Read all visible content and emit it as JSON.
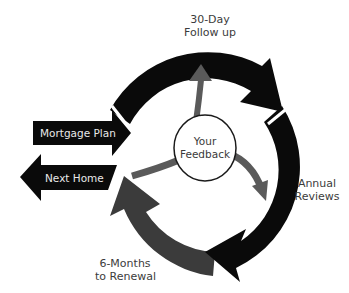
{
  "diagram": {
    "center": {
      "label_line1": "Your",
      "label_line2": "Feedback"
    },
    "cycle_stages": [
      {
        "id": "follow-up",
        "line1": "30-Day",
        "line2": "Follow up"
      },
      {
        "id": "annual-reviews",
        "line1": "Annual",
        "line2": "Reviews"
      },
      {
        "id": "renewal",
        "line1": "6-Months",
        "line2": "to Renewal"
      }
    ],
    "entry_arrow": {
      "label": "Mortgage Plan",
      "direction": "right"
    },
    "exit_arrow": {
      "label": "Next Home",
      "direction": "left"
    },
    "colors": {
      "primary_arrow": "#0a0a0a",
      "secondary_arrow": "#3b3b3b",
      "inner_arrow": "#5a5a5a",
      "text": "#3c3c3c",
      "background": "#ffffff"
    }
  }
}
